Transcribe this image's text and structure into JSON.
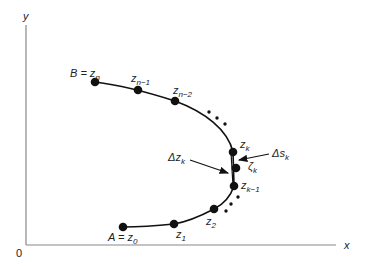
{
  "diagram": {
    "axes": {
      "x_label": "x",
      "y_label": "y",
      "origin_label": "0"
    },
    "points": {
      "A": {
        "label": "A = z",
        "sub": "0"
      },
      "z1": {
        "label": "z",
        "sub": "1"
      },
      "z2": {
        "label": "z",
        "sub": "2"
      },
      "zk1": {
        "label": "z",
        "sub": "k−1"
      },
      "zk": {
        "label": "z",
        "sub": "k"
      },
      "zeta": {
        "label": "ζ",
        "sub": "k"
      },
      "zn2": {
        "label": "z",
        "sub": "n−2"
      },
      "zn1": {
        "label": "z",
        "sub": "n−1"
      },
      "B": {
        "label": "B = z",
        "sub": "n"
      }
    },
    "annotations": {
      "delta_z": {
        "label": "Δz",
        "sub": "k"
      },
      "delta_s": {
        "label": "Δs",
        "sub": "k"
      }
    },
    "colors": {
      "ink": "#111111",
      "axis": "#888888"
    }
  }
}
